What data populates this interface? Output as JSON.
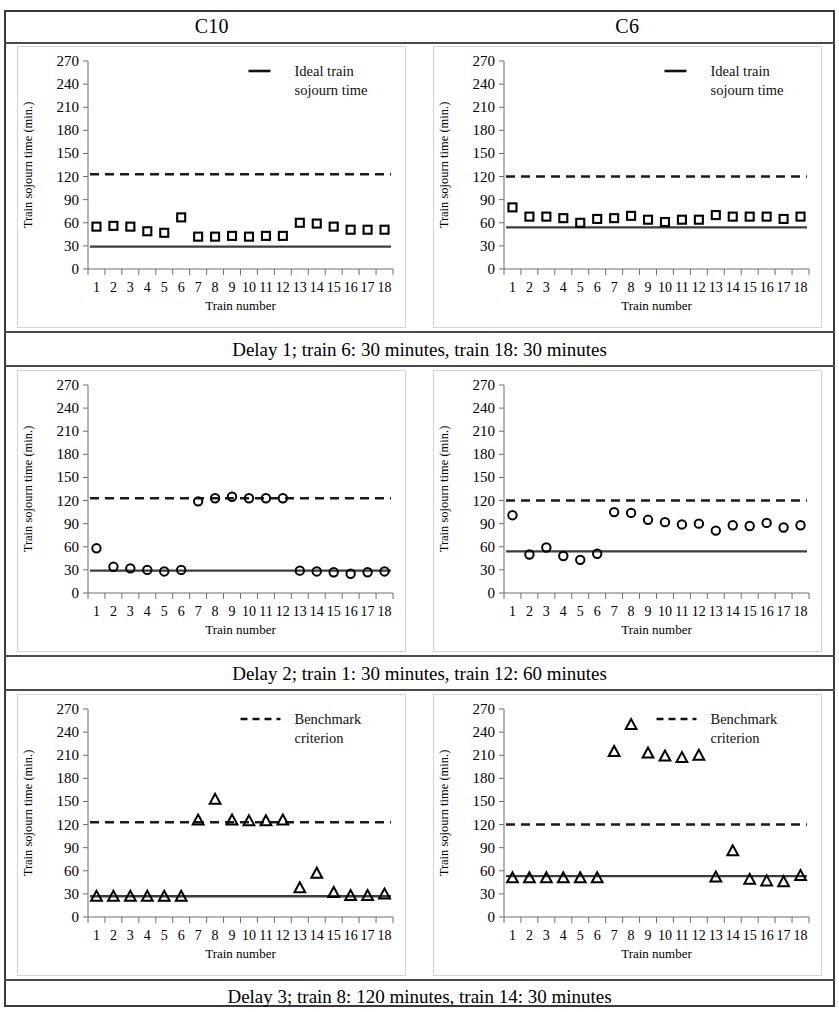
{
  "figure": {
    "columns": [
      "C10",
      "C6"
    ],
    "captions": [
      "Delay 1; train 6: 30 minutes, train 18: 30 minutes",
      "Delay 2; train 1: 30 minutes, train 12: 60 minutes",
      "Delay 3; train 8: 120 minutes, train 14: 30 minutes"
    ]
  },
  "axis": {
    "ylabel": "Train sojourn time (min.)",
    "xlabel": "Train number",
    "yticks": [
      0,
      30,
      60,
      90,
      120,
      150,
      180,
      210,
      240,
      270
    ],
    "xticks": [
      1,
      2,
      3,
      4,
      5,
      6,
      7,
      8,
      9,
      10,
      11,
      12,
      13,
      14,
      15,
      16,
      17,
      18
    ],
    "ylim": [
      0,
      270
    ],
    "grid": false
  },
  "legends": {
    "ideal": {
      "label_line1": "Ideal train",
      "label_line2": "sojourn time",
      "marker": "solid-line"
    },
    "benchmark": {
      "label_line1": "Benchmark",
      "label_line2": "criterion",
      "marker": "dashed-line"
    }
  },
  "colors": {
    "series": "#000000",
    "reference_line": "#3c3c3c",
    "benchmark_line": "#1a1a1a",
    "frame": "#3a3a3a",
    "chart_border": "#d2d2d2"
  },
  "chart_data": [
    {
      "id": "c10-delay1",
      "type": "scatter",
      "title": "C10",
      "subtitle": "Delay 1; train 6: 30 minutes, train 18: 30 minutes",
      "xlabel": "Train number",
      "ylabel": "Train sojourn time (min.)",
      "ylim": [
        0,
        270
      ],
      "grid": false,
      "marker": "square",
      "legend": "Ideal train sojourn time",
      "legend_position": "top-right",
      "categories": [
        1,
        2,
        3,
        4,
        5,
        6,
        7,
        8,
        9,
        10,
        11,
        12,
        13,
        14,
        15,
        16,
        17,
        18
      ],
      "values": [
        55,
        56,
        55,
        49,
        47,
        67,
        42,
        42,
        43,
        42,
        43,
        43,
        60,
        59,
        55,
        51,
        51,
        51
      ],
      "reference_line": {
        "label": "Ideal train sojourn time",
        "value": 29,
        "style": "solid"
      },
      "benchmark_line": {
        "label": "Benchmark criterion",
        "value": 123,
        "style": "dashed"
      }
    },
    {
      "id": "c6-delay1",
      "type": "scatter",
      "title": "C6",
      "subtitle": "Delay 1; train 6: 30 minutes, train 18: 30 minutes",
      "xlabel": "Train number",
      "ylabel": "Train sojourn time (min.)",
      "ylim": [
        0,
        270
      ],
      "grid": false,
      "marker": "square",
      "legend": "Ideal train sojourn time",
      "legend_position": "top-right",
      "categories": [
        1,
        2,
        3,
        4,
        5,
        6,
        7,
        8,
        9,
        10,
        11,
        12,
        13,
        14,
        15,
        16,
        17,
        18
      ],
      "values": [
        80,
        68,
        68,
        66,
        60,
        65,
        66,
        69,
        64,
        61,
        64,
        64,
        70,
        68,
        68,
        68,
        65,
        68
      ],
      "reference_line": {
        "label": "Ideal train sojourn time",
        "value": 54,
        "style": "solid"
      },
      "benchmark_line": {
        "label": "Benchmark criterion",
        "value": 120,
        "style": "dashed"
      }
    },
    {
      "id": "c10-delay2",
      "type": "scatter",
      "title": "C10",
      "subtitle": "Delay 2; train 1: 30 minutes, train 12: 60 minutes",
      "xlabel": "Train number",
      "ylabel": "Train sojourn time (min.)",
      "ylim": [
        0,
        270
      ],
      "grid": false,
      "marker": "circle",
      "legend": "Ideal train sojourn time",
      "legend_position": "none",
      "categories": [
        1,
        2,
        3,
        4,
        5,
        6,
        7,
        8,
        9,
        10,
        11,
        12,
        13,
        14,
        15,
        16,
        17,
        18
      ],
      "values": [
        58,
        34,
        32,
        30,
        28,
        30,
        119,
        123,
        125,
        123,
        123,
        123,
        29,
        28,
        27,
        25,
        27,
        28
      ],
      "reference_line": {
        "label": "Ideal train sojourn time",
        "value": 29,
        "style": "solid"
      },
      "benchmark_line": {
        "label": "Benchmark criterion",
        "value": 123,
        "style": "dashed"
      }
    },
    {
      "id": "c6-delay2",
      "type": "scatter",
      "title": "C6",
      "subtitle": "Delay 2; train 1: 30 minutes, train 12: 60 minutes",
      "xlabel": "Train number",
      "ylabel": "Train sojourn time (min.)",
      "ylim": [
        0,
        270
      ],
      "grid": false,
      "marker": "circle",
      "legend": "Ideal train sojourn time",
      "legend_position": "none",
      "categories": [
        1,
        2,
        3,
        4,
        5,
        6,
        7,
        8,
        9,
        10,
        11,
        12,
        13,
        14,
        15,
        16,
        17,
        18
      ],
      "values": [
        101,
        50,
        59,
        48,
        43,
        51,
        105,
        104,
        95,
        92,
        89,
        90,
        81,
        88,
        87,
        91,
        85,
        88
      ],
      "reference_line": {
        "label": "Ideal train sojourn time",
        "value": 54,
        "style": "solid"
      },
      "benchmark_line": {
        "label": "Benchmark criterion",
        "value": 120,
        "style": "dashed"
      }
    },
    {
      "id": "c10-delay3",
      "type": "scatter",
      "title": "C10",
      "subtitle": "Delay 3; train 8: 120 minutes, train 14: 30 minutes",
      "xlabel": "Train number",
      "ylabel": "Train sojourn time (min.)",
      "ylim": [
        0,
        270
      ],
      "grid": false,
      "marker": "triangle",
      "legend": "Benchmark criterion",
      "legend_position": "top-right",
      "categories": [
        1,
        2,
        3,
        4,
        5,
        6,
        7,
        8,
        9,
        10,
        11,
        12,
        13,
        14,
        15,
        16,
        17,
        18
      ],
      "values": [
        27,
        27,
        27,
        27,
        27,
        27,
        126,
        153,
        126,
        125,
        125,
        126,
        38,
        57,
        32,
        28,
        28,
        30
      ],
      "reference_line": {
        "label": "Ideal train sojourn time",
        "value": 27,
        "style": "solid"
      },
      "benchmark_line": {
        "label": "Benchmark criterion",
        "value": 123,
        "style": "dashed"
      }
    },
    {
      "id": "c6-delay3",
      "type": "scatter",
      "title": "C6",
      "subtitle": "Delay 3; train 8: 120 minutes, train 14: 30 minutes",
      "xlabel": "Train number",
      "ylabel": "Train sojourn time (min.)",
      "ylim": [
        0,
        270
      ],
      "grid": false,
      "marker": "triangle",
      "legend": "Benchmark criterion",
      "legend_position": "top-right",
      "categories": [
        1,
        2,
        3,
        4,
        5,
        6,
        7,
        8,
        9,
        10,
        11,
        12,
        13,
        14,
        15,
        16,
        17,
        18
      ],
      "values": [
        51,
        51,
        51,
        51,
        51,
        51,
        215,
        250,
        213,
        209,
        207,
        210,
        52,
        86,
        49,
        47,
        46,
        54
      ],
      "reference_line": {
        "label": "Ideal train sojourn time",
        "value": 53,
        "style": "solid"
      },
      "benchmark_line": {
        "label": "Benchmark criterion",
        "value": 120,
        "style": "dashed"
      }
    }
  ]
}
